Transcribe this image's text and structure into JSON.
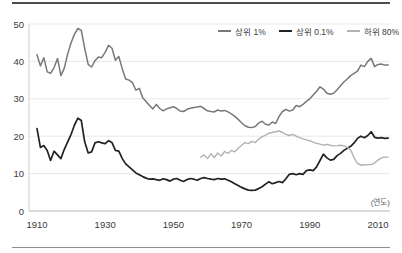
{
  "chart_data": {
    "type": "line",
    "title": "",
    "xlabel": "(연도)",
    "ylabel": "",
    "xlim": [
      1908,
      2014
    ],
    "ylim": [
      0,
      50
    ],
    "xticks": [
      1910,
      1930,
      1950,
      1970,
      1990,
      2010
    ],
    "yticks": [
      0,
      10,
      20,
      30,
      40,
      50
    ],
    "grid": "horizontal",
    "legend_position": "top-right",
    "series": [
      {
        "name": "상위 1%",
        "color": "#787878",
        "start_year": 1910,
        "values": [
          41.8,
          38.8,
          41.0,
          37.2,
          36.8,
          38.3,
          40.8,
          36.2,
          38.2,
          42.0,
          45.0,
          47.3,
          48.8,
          48.3,
          43.5,
          39.2,
          38.5,
          40.2,
          41.2,
          41.0,
          42.5,
          44.3,
          43.5,
          40.3,
          41.3,
          38.0,
          35.3,
          35.0,
          34.3,
          32.3,
          32.8,
          30.3,
          29.3,
          28.2,
          27.3,
          28.5,
          27.4,
          26.8,
          27.3,
          27.6,
          27.9,
          27.4,
          26.7,
          26.6,
          27.2,
          27.5,
          27.7,
          27.8,
          28.0,
          27.4,
          26.8,
          26.6,
          26.5,
          27.0,
          26.7,
          26.9,
          26.5,
          26.0,
          25.3,
          24.5,
          23.6,
          22.8,
          22.4,
          22.3,
          22.6,
          23.5,
          24.0,
          23.2,
          23.0,
          23.8,
          23.4,
          25.3,
          26.6,
          27.2,
          26.7,
          27.0,
          28.2,
          27.9,
          28.5,
          29.3,
          30.0,
          31.0,
          32.0,
          33.2,
          32.6,
          31.5,
          31.2,
          31.5,
          32.4,
          33.5,
          34.5,
          35.3,
          36.2,
          36.8,
          37.4,
          39.0,
          38.6,
          40.0,
          40.8,
          38.6,
          39.2,
          39.3,
          39.0,
          39.0
        ]
      },
      {
        "name": "상위 0.1%",
        "color": "#222222",
        "start_year": 1910,
        "values": [
          22.0,
          17.0,
          17.5,
          16.2,
          13.5,
          16.0,
          15.0,
          14.0,
          16.5,
          18.5,
          20.5,
          23.0,
          24.8,
          24.2,
          18.5,
          15.5,
          15.8,
          18.2,
          18.5,
          18.2,
          18.0,
          18.8,
          18.3,
          16.2,
          16.0,
          14.0,
          12.6,
          11.8,
          11.0,
          10.2,
          9.7,
          9.2,
          8.8,
          8.5,
          8.6,
          8.4,
          8.2,
          8.6,
          8.4,
          8.0,
          8.5,
          8.7,
          8.2,
          7.9,
          8.4,
          8.7,
          8.5,
          8.2,
          8.7,
          8.9,
          8.7,
          8.5,
          8.4,
          8.7,
          8.5,
          8.6,
          8.2,
          7.8,
          7.3,
          6.8,
          6.3,
          5.9,
          5.6,
          5.5,
          5.6,
          6.0,
          6.5,
          7.2,
          7.8,
          7.3,
          7.6,
          7.9,
          7.6,
          8.6,
          9.8,
          10.0,
          9.7,
          10.0,
          9.8,
          10.8,
          11.0,
          10.8,
          11.8,
          13.5,
          15.2,
          14.2,
          13.6,
          13.8,
          14.8,
          15.4,
          16.2,
          16.8,
          17.3,
          18.2,
          19.4,
          20.0,
          19.6,
          20.2,
          21.2,
          19.7,
          19.5,
          19.6,
          19.4,
          19.5
        ]
      },
      {
        "name": "하위 80%",
        "color": "#b2b2b2",
        "start_year": 1958,
        "values": [
          14.4,
          15.0,
          14.0,
          15.3,
          14.3,
          15.5,
          14.7,
          15.9,
          15.4,
          16.2,
          15.8,
          16.8,
          17.6,
          18.3,
          18.0,
          18.6,
          18.3,
          19.2,
          19.8,
          20.3,
          20.8,
          21.0,
          21.2,
          21.4,
          21.0,
          20.5,
          20.2,
          20.5,
          20.0,
          19.6,
          19.3,
          19.0,
          18.8,
          18.4,
          18.1,
          17.9,
          17.6,
          17.8,
          17.6,
          17.4,
          17.5,
          17.6,
          17.4,
          17.0,
          16.3,
          14.2,
          12.7,
          12.3,
          12.3,
          12.4,
          12.4,
          12.8,
          13.6,
          14.2,
          14.4,
          14.4
        ]
      }
    ]
  }
}
